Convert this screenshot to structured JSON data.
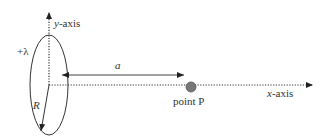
{
  "diagram": {
    "labels": {
      "y_axis": "y",
      "y_axis_suffix": "-axis",
      "x_axis": "x",
      "x_axis_suffix": "-axis",
      "charge": "+λ",
      "distance": "a",
      "radius": "R",
      "point": "point P"
    },
    "colors": {
      "line": "#333333",
      "point_fill": "#777777",
      "background": "#ffffff"
    }
  }
}
